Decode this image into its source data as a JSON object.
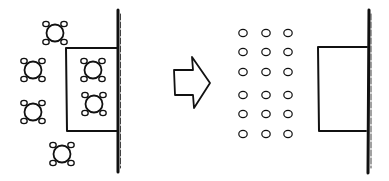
{
  "diagram": {
    "colors": {
      "stroke": "#111111",
      "background": "#ffffff"
    },
    "before": {
      "label": "banquet-layout",
      "table_count": 6,
      "chairs_per_table": 4,
      "tables_on_stage": 2,
      "tables_off_stage": 4
    },
    "arrow": {
      "direction": "right",
      "meaning": "transforms-to"
    },
    "after": {
      "label": "theater-layout",
      "chair_rows": 6,
      "chair_columns": 3,
      "chair_count": 18
    }
  }
}
